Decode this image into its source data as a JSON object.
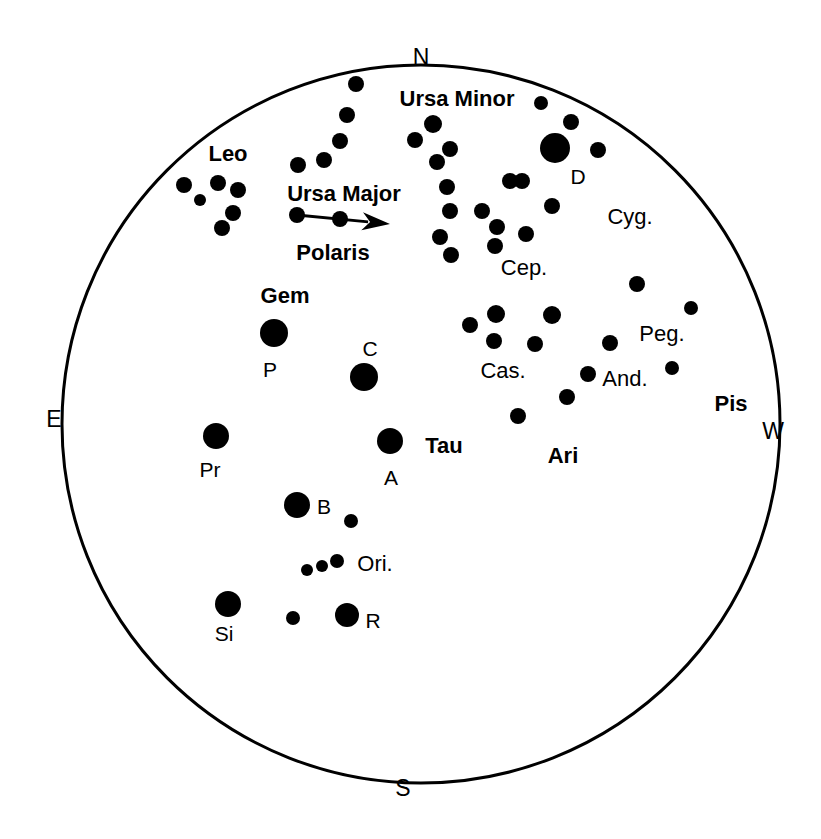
{
  "chart_data": {
    "type": "scatter",
    "colors": {
      "background": "#ffffff",
      "ink": "#000000",
      "horizon_circle": "#000000"
    },
    "horizon": {
      "center_x": 421,
      "center_y": 424,
      "radius": 359,
      "stroke_width": 3
    },
    "cardinals": [
      {
        "name": "north",
        "label": "N",
        "x": 421,
        "y": 57
      },
      {
        "name": "east",
        "label": "E",
        "x": 54,
        "y": 419
      },
      {
        "name": "south",
        "label": "S",
        "x": 403,
        "y": 788
      },
      {
        "name": "west",
        "label": "W",
        "x": 773,
        "y": 431
      }
    ],
    "constellation_labels": [
      {
        "name": "leo",
        "label": "Leo",
        "x": 228,
        "y": 154,
        "bold": true
      },
      {
        "name": "ursa-minor",
        "label": "Ursa Minor",
        "x": 457,
        "y": 99,
        "bold": true
      },
      {
        "name": "ursa-major",
        "label": "Ursa Major",
        "x": 344,
        "y": 194,
        "bold": true
      },
      {
        "name": "polaris",
        "label": "Polaris",
        "x": 333,
        "y": 253,
        "bold": true
      },
      {
        "name": "gemini",
        "label": "Gem",
        "x": 285,
        "y": 296,
        "bold": true
      },
      {
        "name": "taurus",
        "label": "Tau",
        "x": 444,
        "y": 446,
        "bold": true
      },
      {
        "name": "aries",
        "label": "Ari",
        "x": 563,
        "y": 456,
        "bold": true
      },
      {
        "name": "pisces",
        "label": "Pis",
        "x": 731,
        "y": 404,
        "bold": true
      },
      {
        "name": "cygnus",
        "label": "Cyg.",
        "x": 630,
        "y": 217,
        "bold": false
      },
      {
        "name": "cepheus",
        "label": "Cep.",
        "x": 524,
        "y": 268,
        "bold": false
      },
      {
        "name": "cassiopeia",
        "label": "Cas.",
        "x": 503,
        "y": 371,
        "bold": false
      },
      {
        "name": "pegasus",
        "label": "Peg.",
        "x": 662,
        "y": 334,
        "bold": false
      },
      {
        "name": "andromeda",
        "label": "And.",
        "x": 625,
        "y": 379,
        "bold": false
      },
      {
        "name": "orion",
        "label": "Ori.",
        "x": 375,
        "y": 564,
        "bold": false
      }
    ],
    "star_letter_labels": [
      {
        "name": "deneb",
        "label": "D",
        "x": 578,
        "y": 176
      },
      {
        "name": "pollux",
        "label": "P",
        "x": 270,
        "y": 369
      },
      {
        "name": "capella",
        "label": "C",
        "x": 370,
        "y": 348
      },
      {
        "name": "procyon",
        "label": "Pr",
        "x": 210,
        "y": 469
      },
      {
        "name": "aldebaran",
        "label": "A",
        "x": 391,
        "y": 477
      },
      {
        "name": "betelgeuse",
        "label": "B",
        "x": 324,
        "y": 506
      },
      {
        "name": "sirius",
        "label": "Si",
        "x": 224,
        "y": 633
      },
      {
        "name": "rigel",
        "label": "R",
        "x": 373,
        "y": 620
      }
    ],
    "arrow": {
      "name": "pointer-arrow",
      "from_x": 297,
      "from_y": 215,
      "to_x": 390,
      "to_y": 224,
      "head_length": 28,
      "head_half_width": 9,
      "stroke_width": 3
    },
    "stars": [
      {
        "group": "ursa-major",
        "x": 356,
        "y": 84,
        "r": 8
      },
      {
        "group": "ursa-major",
        "x": 347,
        "y": 115,
        "r": 8
      },
      {
        "group": "ursa-major",
        "x": 340,
        "y": 141,
        "r": 8
      },
      {
        "group": "ursa-major",
        "x": 324,
        "y": 160,
        "r": 8
      },
      {
        "group": "ursa-major",
        "x": 298,
        "y": 165,
        "r": 8
      },
      {
        "group": "ursa-major",
        "x": 297,
        "y": 215,
        "r": 8
      },
      {
        "group": "ursa-major",
        "x": 340,
        "y": 219,
        "r": 8
      },
      {
        "group": "leo",
        "x": 184,
        "y": 185,
        "r": 8
      },
      {
        "group": "leo",
        "x": 200,
        "y": 200,
        "r": 6
      },
      {
        "group": "leo",
        "x": 218,
        "y": 183,
        "r": 8
      },
      {
        "group": "leo",
        "x": 238,
        "y": 190,
        "r": 8
      },
      {
        "group": "leo",
        "x": 233,
        "y": 213,
        "r": 8
      },
      {
        "group": "leo",
        "x": 222,
        "y": 228,
        "r": 8
      },
      {
        "group": "ursa-minor",
        "x": 433,
        "y": 124,
        "r": 9
      },
      {
        "group": "ursa-minor",
        "x": 415,
        "y": 140,
        "r": 8
      },
      {
        "group": "ursa-minor",
        "x": 450,
        "y": 149,
        "r": 8
      },
      {
        "group": "ursa-minor",
        "x": 437,
        "y": 162,
        "r": 8
      },
      {
        "group": "ursa-minor",
        "x": 447,
        "y": 187,
        "r": 8
      },
      {
        "group": "ursa-minor",
        "x": 450,
        "y": 211,
        "r": 8
      },
      {
        "group": "ursa-minor",
        "x": 440,
        "y": 237,
        "r": 8
      },
      {
        "group": "ursa-minor",
        "x": 451,
        "y": 255,
        "r": 8
      },
      {
        "group": "ursa-minor",
        "x": 541,
        "y": 103,
        "r": 7
      },
      {
        "group": "cepheus",
        "x": 522,
        "y": 181,
        "r": 8
      },
      {
        "group": "cepheus",
        "x": 497,
        "y": 227,
        "r": 8
      },
      {
        "group": "cepheus",
        "x": 482,
        "y": 211,
        "r": 8
      },
      {
        "group": "cepheus",
        "x": 552,
        "y": 206,
        "r": 8
      },
      {
        "group": "cepheus",
        "x": 510,
        "y": 181,
        "r": 8
      },
      {
        "group": "cepheus",
        "x": 495,
        "y": 246,
        "r": 8
      },
      {
        "group": "cepheus",
        "x": 526,
        "y": 234,
        "r": 8
      },
      {
        "group": "cygnus",
        "x": 555,
        "y": 148,
        "r": 15
      },
      {
        "group": "cygnus",
        "x": 571,
        "y": 122,
        "r": 8
      },
      {
        "group": "cygnus",
        "x": 598,
        "y": 150,
        "r": 8
      },
      {
        "group": "cygnus",
        "x": 637,
        "y": 284,
        "r": 8
      },
      {
        "group": "cassiopeia",
        "x": 470,
        "y": 325,
        "r": 8
      },
      {
        "group": "cassiopeia",
        "x": 496,
        "y": 314,
        "r": 9
      },
      {
        "group": "cassiopeia",
        "x": 494,
        "y": 341,
        "r": 8
      },
      {
        "group": "cassiopeia",
        "x": 535,
        "y": 344,
        "r": 8
      },
      {
        "group": "cassiopeia",
        "x": 552,
        "y": 315,
        "r": 9
      },
      {
        "group": "cassiopeia",
        "x": 567,
        "y": 397,
        "r": 8
      },
      {
        "group": "cassiopeia",
        "x": 518,
        "y": 416,
        "r": 8
      },
      {
        "group": "pegasus",
        "x": 691,
        "y": 308,
        "r": 7
      },
      {
        "group": "pegasus",
        "x": 610,
        "y": 343,
        "r": 8
      },
      {
        "group": "pegasus",
        "x": 672,
        "y": 368,
        "r": 7
      },
      {
        "group": "andromeda",
        "x": 588,
        "y": 374,
        "r": 8
      },
      {
        "group": "gemini",
        "x": 274,
        "y": 333,
        "r": 14
      },
      {
        "group": "auriga",
        "x": 364,
        "y": 377,
        "r": 14
      },
      {
        "group": "canis-minor",
        "x": 216,
        "y": 436,
        "r": 13
      },
      {
        "group": "taurus",
        "x": 390,
        "y": 441,
        "r": 13
      },
      {
        "group": "orion",
        "x": 297,
        "y": 505,
        "r": 13
      },
      {
        "group": "orion",
        "x": 351,
        "y": 521,
        "r": 7
      },
      {
        "group": "orion",
        "x": 307,
        "y": 570,
        "r": 6
      },
      {
        "group": "orion",
        "x": 322,
        "y": 566,
        "r": 6
      },
      {
        "group": "orion",
        "x": 337,
        "y": 561,
        "r": 7
      },
      {
        "group": "orion",
        "x": 347,
        "y": 615,
        "r": 12
      },
      {
        "group": "orion",
        "x": 293,
        "y": 618,
        "r": 7
      },
      {
        "group": "canis-major",
        "x": 228,
        "y": 604,
        "r": 13
      }
    ]
  },
  "figure": {
    "caption": ""
  }
}
